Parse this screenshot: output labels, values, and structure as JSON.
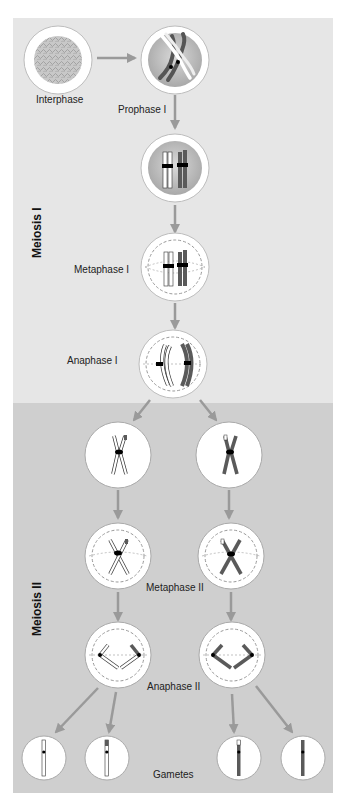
{
  "colors": {
    "meiosis1_bg": "#e6e6e6",
    "meiosis2_bg": "#cfcfcf",
    "arrow": "#9a9a9a",
    "cell_fill": "#ffffff",
    "nucleus_fill": "#c4c4c4",
    "chromosome_light": "#ffffff",
    "chromosome_dark": "#5a5a5a",
    "centromere": "#000000"
  },
  "sections": [
    {
      "label": "Meiosis I"
    },
    {
      "label": "Meiosis II"
    }
  ],
  "stages": {
    "interphase": "Interphase",
    "prophase1": "Prophase I",
    "metaphase1": "Metaphase I",
    "anaphase1": "Anaphase I",
    "metaphase2": "Metaphase II",
    "anaphase2": "Anaphase II",
    "gametes": "Gametes"
  }
}
